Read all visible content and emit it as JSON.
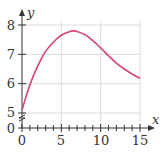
{
  "chart_data": {
    "type": "line",
    "title": "",
    "xlabel": "x",
    "ylabel": "y",
    "xlim": [
      0,
      15
    ],
    "ylim": [
      5,
      8
    ],
    "y_axis_break": true,
    "grid": true,
    "x_ticks": [
      "0",
      "5",
      "10",
      "15"
    ],
    "y_ticks": [
      "0",
      "5",
      "6",
      "7",
      "8"
    ],
    "x_minor_tick_step": 1,
    "series": [
      {
        "name": "curve",
        "color": "#d6456e",
        "x": [
          0,
          0.5,
          1,
          1.5,
          2,
          2.5,
          3,
          4,
          5,
          6,
          6.5,
          7,
          8,
          9,
          10,
          11,
          12,
          13,
          14,
          15
        ],
        "y": [
          5.1,
          5.55,
          5.95,
          6.3,
          6.6,
          6.87,
          7.1,
          7.42,
          7.65,
          7.77,
          7.8,
          7.78,
          7.67,
          7.47,
          7.22,
          6.95,
          6.7,
          6.5,
          6.33,
          6.18
        ]
      }
    ]
  },
  "labels": {
    "x_axis": "x",
    "y_axis": "y",
    "xt0": "0",
    "xt5": "5",
    "xt10": "10",
    "xt15": "15",
    "yt0": "0",
    "yt5": "5",
    "yt6": "6",
    "yt7": "7",
    "yt8": "8"
  },
  "colors": {
    "curve": "#d6456e",
    "grid": "#dddddd",
    "axis": "#333333"
  }
}
